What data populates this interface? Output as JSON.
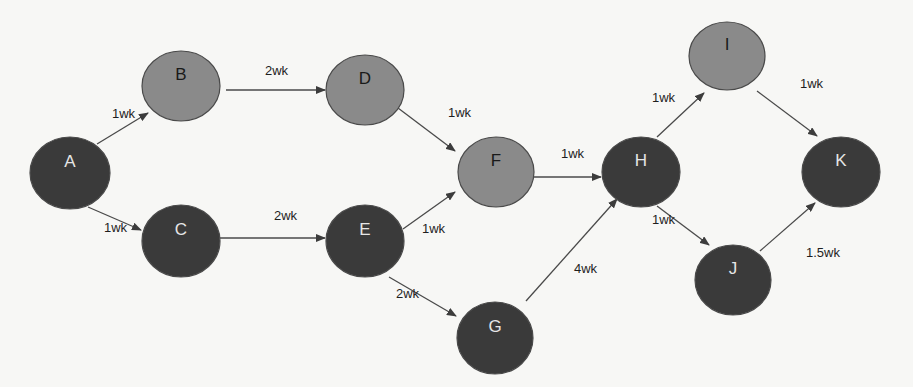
{
  "diagram": {
    "type": "network-activity-diagram",
    "colors": {
      "background": "#f7f7f5",
      "critical_node_fill": "#3a3a3a",
      "critical_node_text": "#e6e6e6",
      "noncritical_node_fill": "#8a8a8a",
      "noncritical_node_text": "#1a1a1a",
      "node_stroke": "#4a4a4a",
      "edge_color": "#4a4a4a"
    },
    "nodes": [
      {
        "id": "A",
        "label": "A",
        "cx": 70,
        "cy": 173,
        "rx": 40,
        "ry": 36,
        "style": "dark"
      },
      {
        "id": "B",
        "label": "B",
        "cx": 181,
        "cy": 86,
        "rx": 39,
        "ry": 35,
        "style": "light"
      },
      {
        "id": "C",
        "label": "C",
        "cx": 181,
        "cy": 241,
        "rx": 39,
        "ry": 36,
        "style": "dark"
      },
      {
        "id": "D",
        "label": "D",
        "cx": 365,
        "cy": 90,
        "rx": 39,
        "ry": 35,
        "style": "light"
      },
      {
        "id": "E",
        "label": "E",
        "cx": 365,
        "cy": 241,
        "rx": 39,
        "ry": 36,
        "style": "dark"
      },
      {
        "id": "F",
        "label": "F",
        "cx": 496,
        "cy": 172,
        "rx": 38,
        "ry": 35,
        "style": "light"
      },
      {
        "id": "G",
        "label": "G",
        "cx": 495,
        "cy": 338,
        "rx": 38,
        "ry": 36,
        "style": "dark"
      },
      {
        "id": "H",
        "label": "H",
        "cx": 641,
        "cy": 172,
        "rx": 39,
        "ry": 35,
        "style": "dark"
      },
      {
        "id": "I",
        "label": "I",
        "cx": 727,
        "cy": 56,
        "rx": 38,
        "ry": 34,
        "style": "light"
      },
      {
        "id": "J",
        "label": "J",
        "cx": 733,
        "cy": 280,
        "rx": 38,
        "ry": 35,
        "style": "dark"
      },
      {
        "id": "K",
        "label": "K",
        "cx": 841,
        "cy": 172,
        "rx": 39,
        "ry": 35,
        "style": "dark"
      }
    ],
    "edges": [
      {
        "from": "A",
        "to": "B",
        "label": "1wk",
        "x1": 97,
        "y1": 144,
        "x2": 148,
        "y2": 113,
        "lx": 112,
        "ly": 118
      },
      {
        "from": "A",
        "to": "C",
        "label": "1wk",
        "x1": 88,
        "y1": 207,
        "x2": 141,
        "y2": 230,
        "lx": 104,
        "ly": 232
      },
      {
        "from": "B",
        "to": "D",
        "label": "2wk",
        "x1": 226,
        "y1": 90,
        "x2": 325,
        "y2": 90,
        "lx": 265,
        "ly": 75
      },
      {
        "from": "C",
        "to": "E",
        "label": "2wk",
        "x1": 220,
        "y1": 238,
        "x2": 325,
        "y2": 238,
        "lx": 274,
        "ly": 220
      },
      {
        "from": "D",
        "to": "F",
        "label": "1wk",
        "x1": 398,
        "y1": 108,
        "x2": 455,
        "y2": 151,
        "lx": 448,
        "ly": 117
      },
      {
        "from": "E",
        "to": "F",
        "label": "1wk",
        "x1": 403,
        "y1": 229,
        "x2": 455,
        "y2": 192,
        "lx": 422,
        "ly": 233
      },
      {
        "from": "E",
        "to": "G",
        "label": "2wk",
        "x1": 389,
        "y1": 277,
        "x2": 456,
        "y2": 316,
        "lx": 396,
        "ly": 298
      },
      {
        "from": "F",
        "to": "H",
        "label": "1wk",
        "x1": 534,
        "y1": 177,
        "x2": 601,
        "y2": 177,
        "lx": 561,
        "ly": 158
      },
      {
        "from": "G",
        "to": "H",
        "label": "4wk",
        "x1": 526,
        "y1": 301,
        "x2": 617,
        "y2": 199,
        "lx": 574,
        "ly": 273
      },
      {
        "from": "H",
        "to": "I",
        "label": "1wk",
        "x1": 657,
        "y1": 137,
        "x2": 704,
        "y2": 93,
        "lx": 652,
        "ly": 102
      },
      {
        "from": "H",
        "to": "J",
        "label": "1wk",
        "x1": 657,
        "y1": 206,
        "x2": 709,
        "y2": 245,
        "lx": 652,
        "ly": 224
      },
      {
        "from": "I",
        "to": "K",
        "label": "1wk",
        "x1": 757,
        "y1": 91,
        "x2": 817,
        "y2": 136,
        "lx": 800,
        "ly": 88
      },
      {
        "from": "J",
        "to": "K",
        "label": "1.5wk",
        "x1": 760,
        "y1": 251,
        "x2": 815,
        "y2": 203,
        "lx": 806,
        "ly": 257
      }
    ]
  }
}
